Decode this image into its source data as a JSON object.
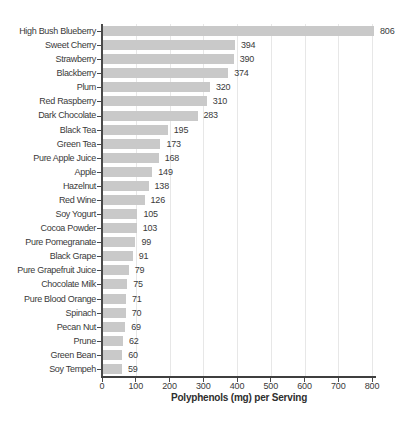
{
  "chart_data": {
    "type": "bar",
    "orientation": "horizontal",
    "title": "",
    "xlabel": "Polyphenols (mg) per Serving",
    "ylabel": "",
    "categories": [
      "High Bush Blueberry",
      "Sweet Cherry",
      "Strawberry",
      "Blackberry",
      "Plum",
      "Red Raspberry",
      "Dark Chocolate",
      "Black Tea",
      "Green Tea",
      "Pure Apple Juice",
      "Apple",
      "Hazelnut",
      "Red Wine",
      "Soy Yogurt",
      "Cocoa Powder",
      "Pure Pomegranate",
      "Black Grape",
      "Pure Grapefruit Juice",
      "Chocolate Milk",
      "Pure Blood Orange",
      "Spinach",
      "Pecan Nut",
      "Prune",
      "Green Bean",
      "Soy Tempeh"
    ],
    "values": [
      806,
      394,
      390,
      374,
      320,
      310,
      283,
      195,
      173,
      168,
      149,
      138,
      126,
      105,
      103,
      99,
      91,
      79,
      75,
      71,
      70,
      69,
      62,
      60,
      59
    ],
    "value_labels": [
      "806",
      "394",
      "390",
      "374",
      "320",
      "310",
      "283",
      "195",
      "173",
      "168",
      "149",
      "138",
      "126",
      "105",
      "103",
      "99",
      "91",
      "79",
      "75",
      "71",
      "70",
      "69",
      "62",
      "60",
      "59"
    ],
    "x_ticks": [
      0,
      100,
      200,
      300,
      400,
      500,
      600,
      700,
      800
    ],
    "x_tick_labels": [
      "0",
      "100",
      "200",
      "300",
      "400",
      "500",
      "600",
      "700",
      "800"
    ],
    "xlim": [
      0,
      880
    ],
    "grid": true,
    "legend_position": "none",
    "colors": {
      "bar_fill": "#c9c9c9",
      "gridline": "#e7e7e7",
      "axis": "#4a4a4a",
      "text": "#3a3a3a",
      "background": "#ffffff"
    }
  }
}
